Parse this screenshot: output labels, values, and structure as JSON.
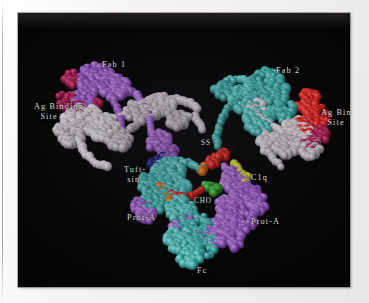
{
  "figure": {
    "kind": "space-filling-molecular-model",
    "background_color": "#050505",
    "page_color": "#f3f2f0",
    "label_color": "#dedbd6"
  },
  "labels": [
    {
      "id": "fab-1",
      "text": "Fab 1",
      "x": 84,
      "y": 47,
      "align": "left"
    },
    {
      "id": "fab-2",
      "text": "Fab 2",
      "x": 258,
      "y": 53,
      "align": "left"
    },
    {
      "id": "ag-binding-left",
      "text": "Ag Binding\n  Site",
      "x": 16,
      "y": 89,
      "align": "left"
    },
    {
      "id": "ag-binding-right",
      "text": "Ag Binding\n  Site",
      "x": 303,
      "y": 95,
      "align": "left"
    },
    {
      "id": "ss-bridge",
      "text": "SS",
      "x": 183,
      "y": 126,
      "align": "left"
    },
    {
      "id": "tuftsin",
      "text": "Tuft-\n sin",
      "x": 106,
      "y": 152,
      "align": "left"
    },
    {
      "id": "c1q",
      "text": "C1q",
      "x": 233,
      "y": 160,
      "align": "left"
    },
    {
      "id": "cho",
      "text": "CHO",
      "x": 176,
      "y": 184,
      "align": "left"
    },
    {
      "id": "prot-a-left",
      "text": "Prot-A",
      "x": 109,
      "y": 200,
      "align": "left"
    },
    {
      "id": "prot-a-right",
      "text": "Prot-A",
      "x": 233,
      "y": 204,
      "align": "left"
    },
    {
      "id": "fc",
      "text": "Fc",
      "x": 179,
      "y": 253,
      "align": "left"
    }
  ],
  "chain_colors": {
    "heavy_chain_left": "#8b4fb4",
    "heavy_chain_right": "#2f9f9c",
    "light_chain": "#cfc8cc",
    "antigen_site_left": "#a8144a",
    "antigen_site_right": "#d8141c",
    "fc_teal": "#2fa8a4",
    "fc_purple": "#8e49c0",
    "cho_red": "#d8201c",
    "cho_orange": "#e06a14",
    "cho_green": "#2ea02e",
    "c1q_yellow": "#c8c81e",
    "tuftsin_navy": "#1c1c6e"
  },
  "plate": {
    "x": 18,
    "y": 13,
    "width": 332,
    "height": 274
  }
}
